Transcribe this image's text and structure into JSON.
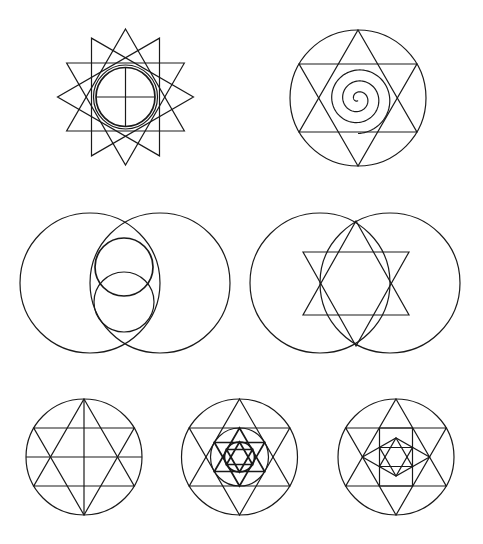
{
  "stroke_color": "#1a1a1a",
  "background_color": "#ffffff",
  "figures": [
    {
      "id": "twelve-point-star",
      "description": "Four overlapping equilateral triangles forming a 12-pointed star, with a double circle and an inner cross",
      "triangles": 4,
      "inner_circles": 2,
      "cross": true
    },
    {
      "id": "hexagram-spiral",
      "description": "Hexagram inscribed in a circle with a spiral in the center",
      "spiral_turns": 3
    },
    {
      "id": "vesica-circles",
      "description": "Two overlapping large circles (vesica piscis) with two smaller circles stacked in the lens"
    },
    {
      "id": "vesica-hexagram",
      "description": "Two overlapping large circles with a hexagram whose vertical points touch the lens tips"
    },
    {
      "id": "hexagram-grid",
      "description": "Circle with an inscribed hexagram, vertical axis and horizontal lines through star vertices"
    },
    {
      "id": "nested-hexagrams",
      "description": "Circle with hexagram containing nested circles and successively smaller hexagrams",
      "levels": 3
    },
    {
      "id": "hexagram-square-lattice",
      "description": "Circle with hexagram containing a square, a rhombus and a small inner hexagram"
    }
  ]
}
